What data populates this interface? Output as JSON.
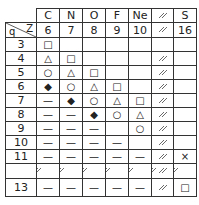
{
  "table": {
    "corner": {
      "row_label": "q",
      "col_label": "Z"
    },
    "columns": [
      {
        "element": "C",
        "z": "6"
      },
      {
        "element": "N",
        "z": "7"
      },
      {
        "element": "O",
        "z": "8"
      },
      {
        "element": "F",
        "z": "9"
      },
      {
        "element": "Ne",
        "z": "10"
      },
      {
        "element": "",
        "z": "",
        "break": true
      },
      {
        "element": "S",
        "z": "16"
      }
    ],
    "rows": [
      {
        "q": "3",
        "cells": [
          "□",
          "",
          "",
          "",
          "",
          "",
          ""
        ]
      },
      {
        "q": "4",
        "cells": [
          "△",
          "□",
          "",
          "",
          "",
          "",
          ""
        ]
      },
      {
        "q": "5",
        "cells": [
          "○",
          "△",
          "□",
          "",
          "",
          "",
          ""
        ]
      },
      {
        "q": "6",
        "cells": [
          "◆",
          "○",
          "△",
          "□",
          "",
          "",
          ""
        ]
      },
      {
        "q": "7",
        "cells": [
          "—",
          "◆",
          "○",
          "△",
          "□",
          "",
          ""
        ]
      },
      {
        "q": "8",
        "cells": [
          "—",
          "—",
          "◆",
          "○",
          "△",
          "",
          ""
        ]
      },
      {
        "q": "9",
        "cells": [
          "—",
          "—",
          "—",
          "",
          "○",
          "",
          ""
        ]
      },
      {
        "q": "10",
        "cells": [
          "—",
          "—",
          "—",
          "—",
          "",
          "",
          ""
        ]
      },
      {
        "q": "11",
        "cells": [
          "—",
          "—",
          "—",
          "—",
          "—",
          "",
          "×"
        ]
      },
      {
        "q": "",
        "cells": [
          "",
          "",
          "",
          "",
          "",
          "",
          ""
        ],
        "break": true
      },
      {
        "q": "13",
        "cells": [
          "—",
          "—",
          "—",
          "—",
          "—",
          "",
          "□"
        ]
      }
    ]
  },
  "legend_symbols": {
    "square": "□",
    "triangle": "△",
    "circle": "○",
    "filled_diamond": "◆",
    "dash": "—",
    "cross": "×",
    "axis_break": "≈"
  }
}
